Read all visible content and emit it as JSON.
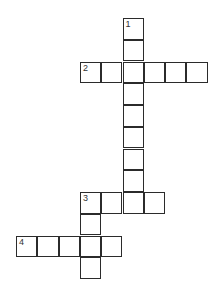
{
  "puzzle": {
    "type": "crossword",
    "cell_size": 21.3,
    "origin": {
      "x": 16,
      "y": 18
    },
    "entries": [
      {
        "number": "1",
        "direction": "down",
        "length": 9,
        "col": 5,
        "row": 0
      },
      {
        "number": "2",
        "direction": "across",
        "length": 6,
        "col": 3,
        "row": 2
      },
      {
        "number": "3",
        "direction": "across",
        "length": 4,
        "col": 3,
        "row": 8
      },
      {
        "number": "3",
        "direction": "down",
        "length": 4,
        "col": 3,
        "row": 8
      },
      {
        "number": "4",
        "direction": "across",
        "length": 5,
        "col": 0,
        "row": 10
      }
    ]
  }
}
